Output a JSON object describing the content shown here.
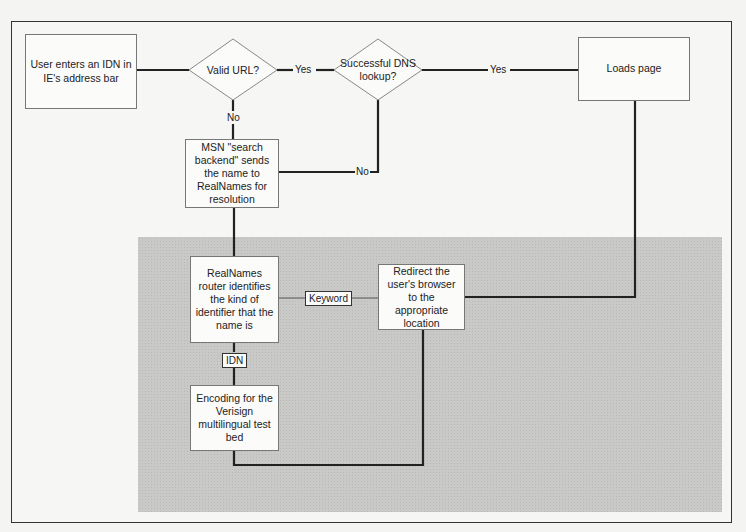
{
  "diagram": {
    "nodes": {
      "start": {
        "label": "User enters an IDN in IE's address bar",
        "shape": "rect"
      },
      "valid_url": {
        "label": "Valid URL?",
        "shape": "diamond"
      },
      "dns_lookup": {
        "label": "Successful DNS lookup?",
        "shape": "diamond"
      },
      "loads_page": {
        "label": "Loads page",
        "shape": "rect"
      },
      "msn_backend": {
        "label": "MSN \"search backend\" sends the name to RealNames for resolution",
        "shape": "rect"
      },
      "realnames_router": {
        "label": "RealNames router identifies the kind of identifier that the name is",
        "shape": "rect"
      },
      "redirect": {
        "label": "Redirect the user's browser to the appropriate location",
        "shape": "rect"
      },
      "encoding": {
        "label": "Encoding for the Verisign multilingual test bed",
        "shape": "rect"
      }
    },
    "edges": {
      "valid_yes": "Yes",
      "valid_no": "No",
      "dns_yes": "Yes",
      "dns_no": "No",
      "router_keyword": "Keyword",
      "router_idn": "IDN"
    },
    "edge_list": [
      {
        "from": "start",
        "to": "valid_url",
        "label": ""
      },
      {
        "from": "valid_url",
        "to": "dns_lookup",
        "label": "Yes"
      },
      {
        "from": "valid_url",
        "to": "msn_backend",
        "label": "No"
      },
      {
        "from": "dns_lookup",
        "to": "loads_page",
        "label": "Yes"
      },
      {
        "from": "dns_lookup",
        "to": "msn_backend",
        "label": "No"
      },
      {
        "from": "msn_backend",
        "to": "realnames_router",
        "label": ""
      },
      {
        "from": "realnames_router",
        "to": "redirect",
        "label": "Keyword"
      },
      {
        "from": "realnames_router",
        "to": "encoding",
        "label": "IDN"
      },
      {
        "from": "encoding",
        "to": "redirect",
        "label": ""
      },
      {
        "from": "redirect",
        "to": "loads_page",
        "label": ""
      }
    ],
    "colors": {
      "line": "#222222",
      "shaded_region": "#c9c9c7",
      "box_fill": "#fbfbfa",
      "box_border": "#777777"
    }
  }
}
